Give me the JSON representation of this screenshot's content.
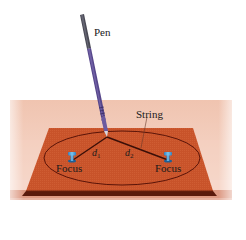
{
  "labels": {
    "pen": "Pen",
    "string": "String",
    "d1_base": "d",
    "d1_sub": "1",
    "d2_base": "d",
    "d2_sub": "2",
    "focus_left": "Focus",
    "focus_right": "Focus"
  },
  "colors": {
    "table": "#f2c9b6",
    "table_edge": "#d9937c",
    "board": "#c8532a",
    "board_edge": "#5a1a0c",
    "ellipse": "#5a1408",
    "string": "#3a0f08",
    "pen_body": "#5a4a8a",
    "pen_cap": "#4a4a55",
    "pin": "#4aa6e0",
    "text": "#1a1a1a"
  }
}
